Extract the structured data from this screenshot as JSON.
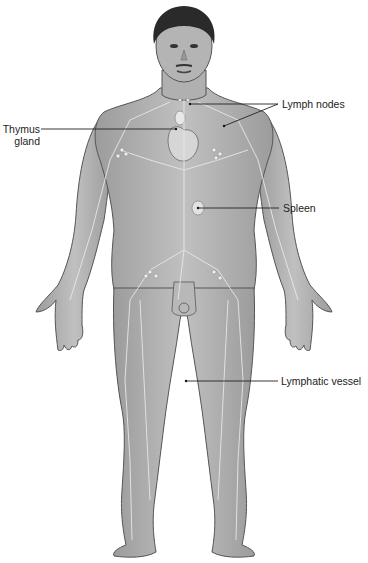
{
  "diagram": {
    "labels": [
      {
        "id": "thymus",
        "line1": "Thymus",
        "line2": "gland"
      },
      {
        "id": "lymph-nodes",
        "text": "Lymph nodes"
      },
      {
        "id": "spleen",
        "text": "Spleen"
      },
      {
        "id": "lymphatic-vessel",
        "text": "Lymphatic vessel"
      }
    ]
  },
  "colors": {
    "skin": "#a9a9a9",
    "skin_light": "#c4c4c4",
    "outline": "#555555",
    "hair": "#2a2a2a",
    "vessel": "#e6e6e6",
    "leader": "#222222"
  }
}
